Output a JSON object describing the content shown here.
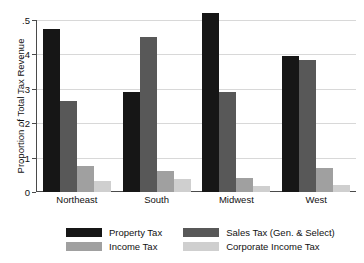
{
  "chart_data": {
    "type": "bar",
    "title": "",
    "xlabel": "",
    "ylabel": "Proportion of Total Tax Revenue",
    "ylim": [
      0,
      0.5
    ],
    "yticks": [
      "0",
      ".1",
      ".2",
      ".3",
      ".4",
      ".5"
    ],
    "ytick_values": [
      0,
      0.1,
      0.2,
      0.3,
      0.4,
      0.5
    ],
    "grid": true,
    "legend_position": "bottom",
    "categories": [
      "Northeast",
      "South",
      "Midwest",
      "West"
    ],
    "series": [
      {
        "name": "Property Tax",
        "color": "#161616",
        "values": [
          0.475,
          0.29,
          0.52,
          0.395
        ]
      },
      {
        "name": "Sales Tax (Gen. & Select)",
        "color": "#585858",
        "values": [
          0.265,
          0.45,
          0.29,
          0.385
        ]
      },
      {
        "name": "Income Tax",
        "color": "#a0a0a0",
        "values": [
          0.075,
          0.06,
          0.04,
          0.07
        ]
      },
      {
        "name": "Corporate Income Tax",
        "color": "#cfcfcf",
        "values": [
          0.033,
          0.038,
          0.018,
          0.02
        ]
      }
    ]
  },
  "axis": {
    "y_title": "Proportion of Total Tax Revenue"
  },
  "legend": {
    "items": [
      {
        "label": "Property Tax",
        "color": "#161616"
      },
      {
        "label": "Sales Tax (Gen. & Select)",
        "color": "#585858"
      },
      {
        "label": "Income Tax",
        "color": "#a0a0a0"
      },
      {
        "label": "Corporate Income Tax",
        "color": "#cfcfcf"
      }
    ]
  }
}
